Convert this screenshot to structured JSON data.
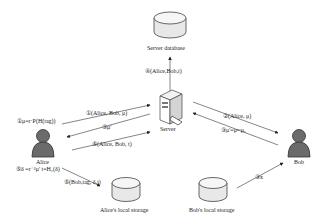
{
  "nodes": {
    "server_db": {
      "label": "Server database"
    },
    "server": {
      "label": "Server"
    },
    "alice": {
      "label": "Alice"
    },
    "bob": {
      "label": "Bob"
    },
    "alice_storage": {
      "label": "Alice's local storage"
    },
    "bob_storage": {
      "label": "Bob's local storage"
    }
  },
  "messages": {
    "m1": "①μ=r·P(H(tag))",
    "m1b": "①(Alice, Bob, μ)",
    "m2": "②(Alice, μ)",
    "m3": "③μ'=μˣ·μ₂",
    "m3b": "③μ'",
    "m4": "④(Alice,Bob,t)",
    "m5": "⑤(Alice, Bob, t)",
    "m6": "⑤δ =r⁻¹μ'  t=H₂(δ)",
    "m7": "⑤(Bob,tag, δ,t)",
    "m8": "③x"
  }
}
